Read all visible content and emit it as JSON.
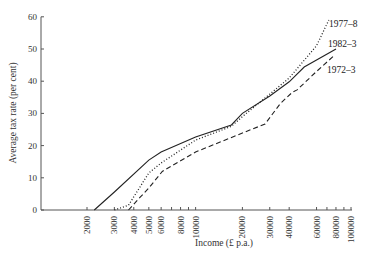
{
  "chart_data": {
    "type": "line",
    "title": "",
    "xlabel": "Income (£ p.a.)",
    "ylabel": "Average tax rate (per cent)",
    "xscale": "log",
    "xlim": [
      2000,
      100000
    ],
    "ylim": [
      0,
      60
    ],
    "grid": false,
    "legend_position": "inline labels at line ends (upper right)",
    "y_ticks": [
      0,
      10,
      20,
      30,
      40,
      50,
      60
    ],
    "x_ticks": [
      2000,
      3000,
      4000,
      5000,
      6000,
      7000,
      8000,
      9000,
      10000,
      20000,
      30000,
      40000,
      60000,
      70000,
      80000,
      90000,
      100000
    ],
    "x_tick_labels": [
      "2000",
      "3000",
      "4000",
      "5000",
      "6000",
      "8000",
      "10000",
      "20000",
      "30000",
      "40000",
      "60000",
      "80000",
      "100000"
    ],
    "series": [
      {
        "name": "1977–8",
        "style": "dotted",
        "points": [
          [
            3000,
            0
          ],
          [
            3700,
            1.5
          ],
          [
            5000,
            11.5
          ],
          [
            6000,
            14.6
          ],
          [
            10000,
            21.7
          ],
          [
            17000,
            26
          ],
          [
            20000,
            29
          ],
          [
            30000,
            36
          ],
          [
            40000,
            41
          ],
          [
            60000,
            51
          ],
          [
            72000,
            59
          ]
        ]
      },
      {
        "name": "1982–3",
        "style": "solid",
        "points": [
          [
            2230,
            0
          ],
          [
            3000,
            5.6
          ],
          [
            5000,
            15.5
          ],
          [
            6000,
            18
          ],
          [
            10000,
            22.7
          ],
          [
            17000,
            26.4
          ],
          [
            20000,
            30
          ],
          [
            30000,
            35.4
          ],
          [
            40000,
            39.8
          ],
          [
            50000,
            44.4
          ],
          [
            80000,
            50
          ]
        ]
      },
      {
        "name": "1972–3",
        "style": "dashed",
        "points": [
          [
            3700,
            0
          ],
          [
            4400,
            4
          ],
          [
            5000,
            6.8
          ],
          [
            6100,
            12
          ],
          [
            10000,
            18
          ],
          [
            20000,
            23.9
          ],
          [
            28000,
            26.7
          ],
          [
            35000,
            33
          ],
          [
            42000,
            36.6
          ],
          [
            45000,
            37.3
          ],
          [
            60000,
            43
          ],
          [
            78000,
            48
          ]
        ]
      }
    ]
  },
  "labels": {
    "y_axis_title": "Average tax rate (per cent)",
    "x_axis_title": "Income (£ p.a.)",
    "series_1977": "1977–8",
    "series_1982": "1982–3",
    "series_1972": "1972–3"
  }
}
